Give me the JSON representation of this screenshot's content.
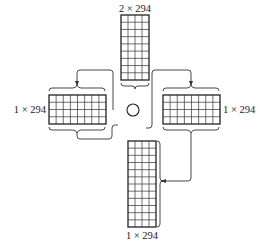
{
  "diagram": {
    "type": "solar-panel-array-layout",
    "colors": {
      "stroke": "#222222",
      "background": "#ffffff"
    },
    "hub": {
      "shape": "circle",
      "cx": 133,
      "cy": 110,
      "r": 6
    },
    "panels": [
      {
        "id": "top",
        "label": "2 × 294",
        "x": 121,
        "y": 15,
        "w": 28,
        "h": 65,
        "cols": 4,
        "rows": 9,
        "label_pos": "above"
      },
      {
        "id": "left",
        "label": "1 × 294",
        "x": 49,
        "y": 95,
        "w": 57,
        "h": 29,
        "cols": 8,
        "rows": 4,
        "label_pos": "left"
      },
      {
        "id": "right",
        "label": "1 × 294",
        "x": 163,
        "y": 95,
        "w": 57,
        "h": 29,
        "cols": 8,
        "rows": 4,
        "label_pos": "right"
      },
      {
        "id": "bottom",
        "label": "1 × 294",
        "x": 128,
        "y": 141,
        "w": 28,
        "h": 86,
        "cols": 4,
        "rows": 12,
        "label_pos": "below"
      }
    ],
    "connections": [
      {
        "from": "hub",
        "to": "left",
        "arrow": true
      },
      {
        "from": "hub",
        "to": "right",
        "arrow": true
      },
      {
        "from": "right",
        "to": "bottom",
        "arrow": true
      },
      {
        "from": "left",
        "to": "hub",
        "arrow": false
      },
      {
        "from": "top",
        "to": "hub",
        "arrow": false
      }
    ]
  },
  "labels": {
    "top": "2 × 294",
    "left": "1 × 294",
    "right": "1 × 294",
    "bottom": "1 × 294"
  }
}
